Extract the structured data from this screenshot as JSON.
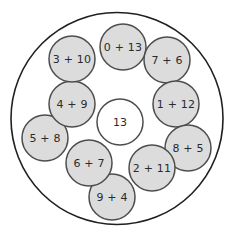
{
  "figure": {
    "background_color": "#ffffff",
    "width": 234,
    "height": 242
  },
  "outer_boundary": {
    "name": "outer-circle",
    "center_x": 117,
    "center_y": 118.5,
    "radius": 106,
    "fill": "#ffffff",
    "stroke": "#231f20"
  },
  "center_node": {
    "label": "13",
    "center_x": 120,
    "center_y": 122,
    "radius": 23,
    "fill": "#ffffff",
    "stroke": "#4d4d4d"
  },
  "ring_nodes": [
    {
      "label": "0 + 13",
      "center_x": 123,
      "center_y": 47,
      "radius": 23
    },
    {
      "label": "7 + 6",
      "center_x": 167,
      "center_y": 60,
      "radius": 23
    },
    {
      "label": "1 + 12",
      "center_x": 176,
      "center_y": 104,
      "radius": 23
    },
    {
      "label": "8 + 5",
      "center_x": 188,
      "center_y": 148,
      "radius": 23
    },
    {
      "label": "2 + 11",
      "center_x": 152,
      "center_y": 168,
      "radius": 23
    },
    {
      "label": "9 + 4",
      "center_x": 112,
      "center_y": 197,
      "radius": 23
    },
    {
      "label": "6 + 7",
      "center_x": 89,
      "center_y": 163,
      "radius": 23
    },
    {
      "label": "5 + 8",
      "center_x": 45,
      "center_y": 138,
      "radius": 23
    },
    {
      "label": "4 + 9",
      "center_x": 72,
      "center_y": 104,
      "radius": 23
    },
    {
      "label": "3 + 10",
      "center_x": 72,
      "center_y": 59,
      "radius": 23
    }
  ],
  "colors": {
    "node_fill": "#dcdcdc",
    "node_stroke": "#4d4d4d",
    "boundary_stroke": "#231f20",
    "text": "#2b2b2b",
    "center_fill": "#ffffff"
  }
}
